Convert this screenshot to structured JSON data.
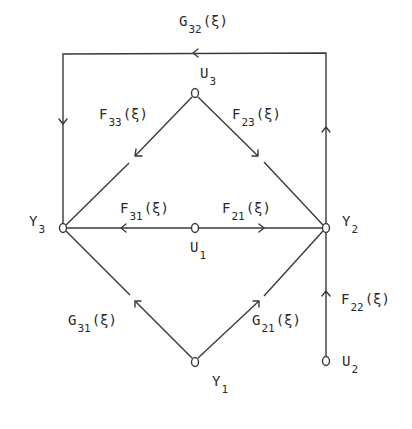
{
  "diagram": {
    "type": "signal-flow-graph",
    "colors": {
      "line": "#3a3a3a",
      "text": "#2a2a2a",
      "background": "#ffffff"
    },
    "nodes": {
      "U3": {
        "name": "U",
        "sub": "3"
      },
      "Y3": {
        "name": "Y",
        "sub": "3"
      },
      "Y2": {
        "name": "Y",
        "sub": "2"
      },
      "U1": {
        "name": "U",
        "sub": "1"
      },
      "Y1": {
        "name": "Y",
        "sub": "1"
      },
      "U2": {
        "name": "U",
        "sub": "2"
      }
    },
    "edges": {
      "G32": {
        "name": "G",
        "sub": "32",
        "arg": "(ξ)",
        "from": "Y2",
        "to": "Y3",
        "route": "top-rectangle"
      },
      "F33": {
        "name": "F",
        "sub": "33",
        "arg": "(ξ)",
        "from": "U3",
        "to": "Y3"
      },
      "F23": {
        "name": "F",
        "sub": "23",
        "arg": "(ξ)",
        "from": "U3",
        "to": "Y2"
      },
      "F31": {
        "name": "F",
        "sub": "31",
        "arg": "(ξ)",
        "from": "U1",
        "to": "Y3"
      },
      "F21": {
        "name": "F",
        "sub": "21",
        "arg": "(ξ)",
        "from": "U1",
        "to": "Y2"
      },
      "G31": {
        "name": "G",
        "sub": "31",
        "arg": "(ξ)",
        "from": "Y1",
        "to": "Y3"
      },
      "G21": {
        "name": "G",
        "sub": "21",
        "arg": "(ξ)",
        "from": "Y1",
        "to": "Y2"
      },
      "F22": {
        "name": "F",
        "sub": "22",
        "arg": "(ξ)",
        "from": "U2",
        "to": "Y2"
      }
    }
  }
}
